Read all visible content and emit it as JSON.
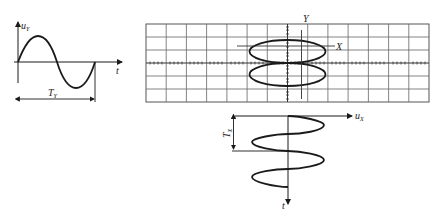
{
  "left_plot": {
    "y_label": "u",
    "y_label_sub": "Y",
    "x_label": "t",
    "period_label": "T",
    "period_label_sub": "Y"
  },
  "screen": {
    "columns": 14,
    "rows": 6,
    "label_y_axis": "Y",
    "label_x_axis": "X"
  },
  "bottom_plot": {
    "x_label": "u",
    "x_label_sub": "X",
    "t_label": "t",
    "period_label": "T",
    "period_label_sub": "X"
  },
  "colors": {
    "line": "#1a1a1a",
    "grid": "#555555",
    "background": "#ffffff"
  }
}
